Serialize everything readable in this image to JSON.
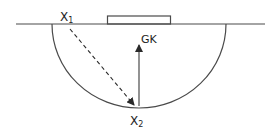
{
  "diagram": {
    "title": "",
    "labels": {
      "x1": "X",
      "x1_sub": "1",
      "x2": "X",
      "x2_sub": "2",
      "gk": "GK"
    },
    "colors": {
      "line": "#4a4a4a",
      "text": "#1e1e1e",
      "background": "#ffffff"
    },
    "elements": [
      {
        "type": "baseline",
        "description": "goal line"
      },
      {
        "type": "goal",
        "description": "goal rectangle on the line"
      },
      {
        "type": "semicircle",
        "description": "shooting circle / D"
      },
      {
        "type": "arrow",
        "style": "dashed",
        "from": "X1",
        "to": "X2"
      },
      {
        "type": "arrow",
        "style": "solid",
        "from": "X2",
        "to": "GK"
      }
    ]
  }
}
